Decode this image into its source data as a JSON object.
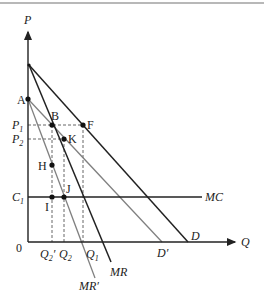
{
  "diagram": {
    "type": "monopoly demand shift diagram",
    "axes": {
      "y_label": "P",
      "x_label": "Q",
      "origin_label": "0"
    },
    "price_labels": {
      "p1": {
        "base": "P",
        "sub": "1"
      },
      "p2": {
        "base": "P",
        "sub": "2"
      },
      "c1": {
        "base": "C",
        "sub": "1"
      }
    },
    "quantity_labels": {
      "q2_prime": {
        "base": "Q",
        "sub": "2",
        "suffix": "′"
      },
      "q2": {
        "base": "Q",
        "sub": "2"
      },
      "q1": {
        "base": "Q",
        "sub": "1"
      }
    },
    "curves": {
      "demand": "D",
      "demand_prime": "D′",
      "marginal_revenue": "MR",
      "marginal_revenue_prime": "MR′",
      "marginal_cost": "MC"
    },
    "points": {
      "a": "A",
      "b": "B",
      "f": "F",
      "k": "K",
      "h": "H",
      "i": "I",
      "j": "J"
    },
    "colors": {
      "dark_line": "#222222",
      "gray_line": "#808080",
      "dashed": "#555555"
    }
  }
}
